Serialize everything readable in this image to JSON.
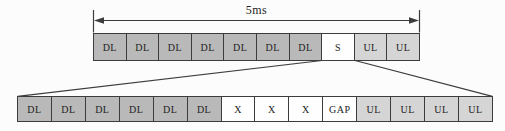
{
  "diagram": {
    "duration_label": "5ms",
    "colors": {
      "dl_fill": "#b9b9b9",
      "ul_fill": "#d5d5d5",
      "special_fill": "#fefefe",
      "border": "#3c3c3c",
      "text": "#222222",
      "background": "#fcfcfc"
    },
    "top_row": {
      "cells": [
        {
          "label": "DL",
          "type": "dl"
        },
        {
          "label": "DL",
          "type": "dl"
        },
        {
          "label": "DL",
          "type": "dl"
        },
        {
          "label": "DL",
          "type": "dl"
        },
        {
          "label": "DL",
          "type": "dl"
        },
        {
          "label": "DL",
          "type": "dl"
        },
        {
          "label": "DL",
          "type": "dl"
        },
        {
          "label": "S",
          "type": "special"
        },
        {
          "label": "UL",
          "type": "ul"
        },
        {
          "label": "UL",
          "type": "ul"
        }
      ]
    },
    "bottom_row": {
      "cells": [
        {
          "label": "DL",
          "type": "dl"
        },
        {
          "label": "DL",
          "type": "dl"
        },
        {
          "label": "DL",
          "type": "dl"
        },
        {
          "label": "DL",
          "type": "dl"
        },
        {
          "label": "DL",
          "type": "dl"
        },
        {
          "label": "DL",
          "type": "dl"
        },
        {
          "label": "X",
          "type": "special"
        },
        {
          "label": "X",
          "type": "special"
        },
        {
          "label": "X",
          "type": "special"
        },
        {
          "label": "GAP",
          "type": "special"
        },
        {
          "label": "UL",
          "type": "ul"
        },
        {
          "label": "UL",
          "type": "ul"
        },
        {
          "label": "UL",
          "type": "ul"
        },
        {
          "label": "UL",
          "type": "ul"
        }
      ]
    }
  }
}
